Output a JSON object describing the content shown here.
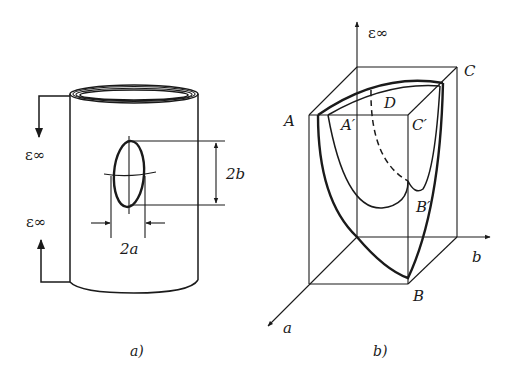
{
  "figure_a": {
    "caption": "a)",
    "load_top_label": "ε∞",
    "load_bottom_label": "ε∞",
    "crack_height_label": "2b",
    "crack_width_label": "2a"
  },
  "figure_b": {
    "caption": "b)",
    "axis_vertical_label": "ε∞",
    "axis_b_label": "b",
    "axis_a_label": "a",
    "points": {
      "A": "A",
      "A_prime": "A′",
      "B": "B",
      "B_prime": "B′",
      "C": "C",
      "C_prime": "C′",
      "D": "D"
    }
  },
  "colors": {
    "ink": "#1a1a1a",
    "background": "#ffffff"
  }
}
